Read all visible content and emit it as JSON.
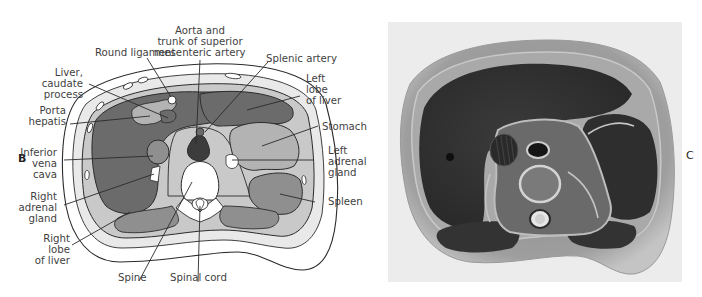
{
  "figure": {
    "panel_b": {
      "letter": "B",
      "type": "labeled anatomical line drawing, transverse section of upper abdomen",
      "labels": {
        "round_ligament": "Round ligament",
        "aorta_line1": "Aorta and",
        "aorta_line2": "trunk of superior",
        "aorta_line3": "mesenteric artery",
        "splenic_artery": "Splenic artery",
        "left_lobe_line1": "Left",
        "left_lobe_line2": "lobe",
        "left_lobe_line3": "of liver",
        "stomach": "Stomach",
        "left_adrenal_line1": "Left",
        "left_adrenal_line2": "adrenal",
        "left_adrenal_line3": "gland",
        "spleen": "Spleen",
        "spinal_cord": "Spinal cord",
        "spine": "Spine",
        "right_lobe_line1": "Right",
        "right_lobe_line2": "lobe",
        "right_lobe_line3": "of liver",
        "right_adrenal_line1": "Right",
        "right_adrenal_line2": "adrenal",
        "right_adrenal_line3": "gland",
        "ivc_line1": "Inferior",
        "ivc_line2": "vena",
        "ivc_line3": "cava",
        "porta_line1": "Porta",
        "porta_line2": "hepatis",
        "caudate_line1": "Liver,",
        "caudate_line2": "caudate",
        "caudate_line3": "process"
      }
    },
    "panel_c": {
      "letter": "C",
      "type": "grayscale photograph of corresponding cadaver cross-section"
    },
    "colors": {
      "organ_dark": "#6b6b6b",
      "organ_mid": "#8f8f8f",
      "organ_light": "#b3b3b3",
      "tissue": "#c9c9c9",
      "bone": "#ffffff",
      "aorta_dark": "#3c3c3c",
      "photo_bg": "#ececec"
    }
  }
}
